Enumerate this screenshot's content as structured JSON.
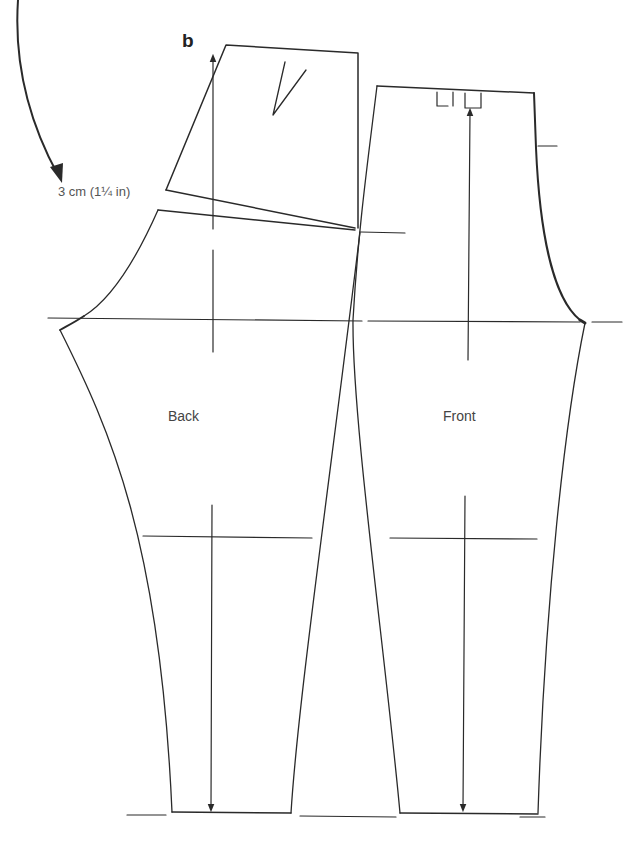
{
  "figure": {
    "label": "b",
    "type": "trouser pattern draft (back and front pieces)",
    "line_color": "#2a2a2a",
    "background": "#ffffff"
  },
  "annotations": {
    "measurement": "3 cm (1¼ in)"
  },
  "pieces": [
    {
      "id": "back",
      "label": "Back"
    },
    {
      "id": "front",
      "label": "Front"
    }
  ],
  "guide_lines": [
    {
      "name": "hip-line"
    },
    {
      "name": "crotch-line"
    },
    {
      "name": "knee-line"
    },
    {
      "name": "hem-line"
    }
  ],
  "icons": {
    "rotation_arrow": "curved-arrow",
    "grain_arrows": "straight-grain-line-arrow"
  }
}
